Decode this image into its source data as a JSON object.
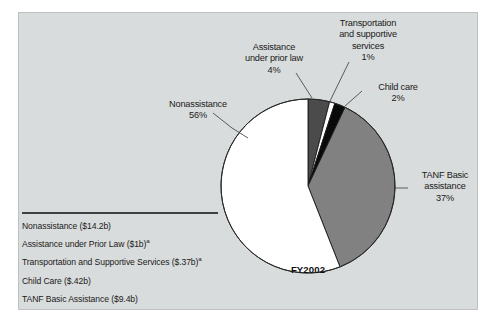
{
  "figure": {
    "period_label": "FY2002",
    "background_color": "#d9dcdc",
    "border_color": "#bcc0c0"
  },
  "callouts": {
    "nonassistance": "Nonassistance\n56%",
    "prior_law": "Assistance\nunder prior law\n4%",
    "transportation": "Transportation\nand supportive\nservices\n1%",
    "child_care": "Child care\n2%",
    "tanf_basic": "TANF Basic\nassistance\n37%"
  },
  "legend": {
    "items": [
      {
        "text": "Nonassistance ($14.2b)",
        "footnote": ""
      },
      {
        "text": "Assistance under Prior Law ($1b)",
        "footnote": "a"
      },
      {
        "text": "Transportation and Supportive Services ($.37b)",
        "footnote": "a"
      },
      {
        "text": "Child Care ($.42b)",
        "footnote": ""
      },
      {
        "text": "TANF Basic Assistance ($9.4b)",
        "footnote": ""
      }
    ]
  },
  "chart_data": {
    "type": "pie",
    "title": "",
    "subtitle": "FY2002",
    "legend_position": "bottom-left",
    "grid": false,
    "start_angle_deg": 0,
    "direction": "clockwise",
    "total_label": "FY2002",
    "categories": [
      "Assistance under prior law",
      "Transportation and supportive services",
      "Child care",
      "TANF Basic assistance",
      "Nonassistance"
    ],
    "values": [
      4,
      1,
      2,
      37,
      56
    ],
    "value_unit": "percent",
    "amounts_billions": [
      1.0,
      0.37,
      0.42,
      9.4,
      14.2
    ],
    "slice_colors": [
      "#4b4b4b",
      "#ffffff",
      "#0a0a0a",
      "#818181",
      "#ffffff"
    ],
    "slice_labels": [
      "4%",
      "1%",
      "2%",
      "37%",
      "56%"
    ],
    "legend_entries": [
      "Nonassistance ($14.2b)",
      "Assistance under Prior Law ($1b)a",
      "Transportation and Supportive Services ($.37b)a",
      "Child Care ($.42b)",
      "TANF Basic Assistance ($9.4b)"
    ]
  },
  "geometry": {
    "center_x": 308,
    "center_y": 186,
    "radius": 87
  }
}
